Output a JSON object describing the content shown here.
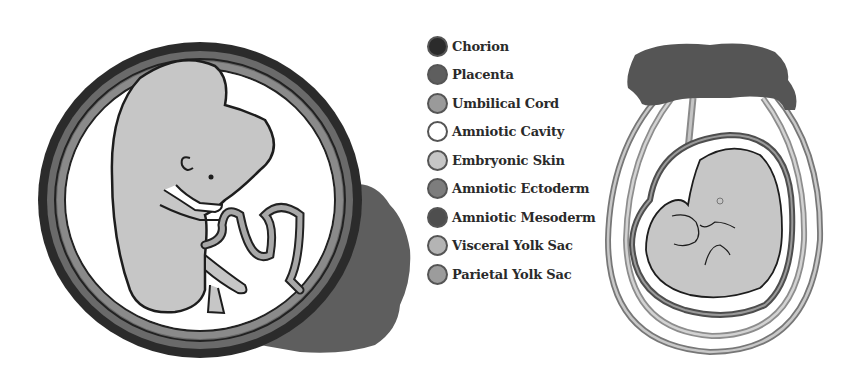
{
  "legend": {
    "items": [
      {
        "label": "Chorion",
        "color": "#2b2b2b"
      },
      {
        "label": "Placenta",
        "color": "#5e5e5e"
      },
      {
        "label": "Umbilical Cord",
        "color": "#9a9a9a"
      },
      {
        "label": "Amniotic Cavity",
        "color": "#ffffff"
      },
      {
        "label": "Embryonic Skin",
        "color": "#c6c6c6"
      },
      {
        "label": "Amniotic Ectoderm",
        "color": "#7d7d7d"
      },
      {
        "label": "Amniotic Mesoderm",
        "color": "#4e4e4e"
      },
      {
        "label": "Visceral Yolk Sac",
        "color": "#b4b4b4"
      },
      {
        "label": "Parietal Yolk Sac",
        "color": "#9c9c9c"
      }
    ]
  }
}
